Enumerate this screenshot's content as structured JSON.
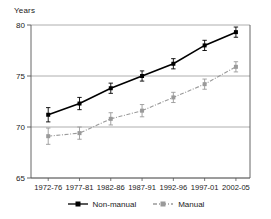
{
  "chart_data": {
    "type": "line",
    "title": "",
    "subtitle": "",
    "xlabel": "",
    "ylabel": "Years",
    "categories": [
      "1972-76",
      "1977-81",
      "1982-86",
      "1987-91",
      "1992-96",
      "1997-01",
      "2002-05"
    ],
    "ylim": [
      65,
      80
    ],
    "yticks": [
      65,
      70,
      75,
      80
    ],
    "ytick_labels": [
      "65",
      "70",
      "75",
      "80"
    ],
    "grid": "horizontal",
    "legend_position": "bottom",
    "errorbars": true,
    "series": [
      {
        "name": "Non-manual",
        "color": "#000000",
        "linestyle": "solid",
        "marker": "square",
        "values": [
          71.2,
          72.3,
          73.8,
          75.0,
          76.2,
          78.0,
          79.3
        ],
        "errors": [
          0.7,
          0.6,
          0.5,
          0.5,
          0.5,
          0.5,
          0.5
        ]
      },
      {
        "name": "Manual",
        "color": "#9a9a9a",
        "linestyle": "dash-dot",
        "marker": "square",
        "values": [
          69.1,
          69.4,
          70.8,
          71.6,
          72.9,
          74.2,
          75.9
        ],
        "errors": [
          0.8,
          0.6,
          0.6,
          0.6,
          0.5,
          0.5,
          0.5
        ]
      }
    ]
  },
  "legend": {
    "items": [
      {
        "label": "Non-manual"
      },
      {
        "label": "Manual"
      }
    ]
  },
  "colors": {
    "axis": "#555555",
    "grid": "#9a9a9a",
    "non_manual": "#000000",
    "manual": "#9a9a9a",
    "text": "#1a1a1a",
    "background": "#ffffff"
  }
}
